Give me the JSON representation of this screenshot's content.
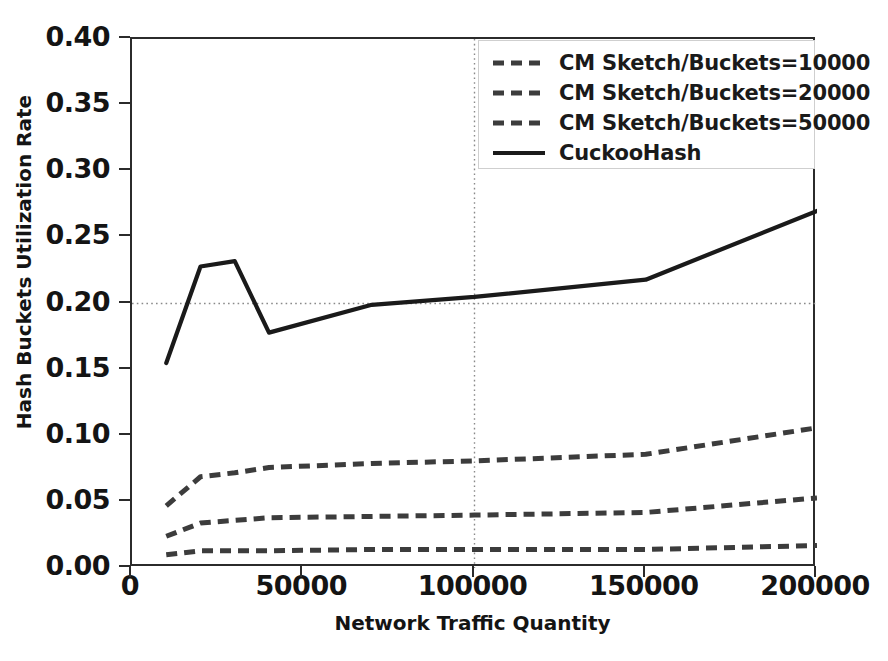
{
  "chart_data": {
    "type": "line",
    "title": "",
    "xlabel": "Network Traffic Quantity",
    "ylabel": "Hash Buckets Utilization Rate",
    "xlim": [
      0,
      200000
    ],
    "ylim": [
      0.0,
      0.4
    ],
    "xticks": [
      0,
      50000,
      100000,
      150000,
      200000
    ],
    "xtick_labels": [
      "0",
      "50000",
      "100000",
      "150000",
      "200000"
    ],
    "yticks": [
      0.0,
      0.05,
      0.1,
      0.15,
      0.2,
      0.25,
      0.3,
      0.35,
      0.4
    ],
    "ytick_labels": [
      "0.00",
      "0.05",
      "0.10",
      "0.15",
      "0.20",
      "0.25",
      "0.30",
      "0.35",
      "0.40"
    ],
    "grid": "dotted-crosshair",
    "gridlines": {
      "vertical_x": 100000,
      "horizontal_y": 0.2
    },
    "legend_position": "upper right",
    "x": [
      10000,
      20000,
      30000,
      40000,
      70000,
      100000,
      150000,
      200000
    ],
    "series": [
      {
        "name": "CM Sketch/Buckets=10000",
        "style": "dashed",
        "color": "#3c3c3c",
        "values": [
          0.047,
          0.069,
          0.072,
          0.076,
          0.079,
          0.081,
          0.086,
          0.106
        ]
      },
      {
        "name": "CM Sketch/Buckets=20000",
        "style": "dashed",
        "color": "#3c3c3c",
        "values": [
          0.024,
          0.034,
          0.036,
          0.038,
          0.039,
          0.04,
          0.042,
          0.053
        ]
      },
      {
        "name": "CM Sketch/Buckets=50000",
        "style": "dashed",
        "color": "#3c3c3c",
        "values": [
          0.01,
          0.013,
          0.013,
          0.013,
          0.014,
          0.014,
          0.014,
          0.017
        ]
      },
      {
        "name": "CuckooHash",
        "style": "solid",
        "color": "#1a1a1a",
        "values": [
          0.155,
          0.228,
          0.232,
          0.178,
          0.199,
          0.205,
          0.218,
          0.27
        ]
      }
    ]
  },
  "legend": {
    "entries": [
      {
        "label": "CM Sketch/Buckets=10000"
      },
      {
        "label": "CM Sketch/Buckets=20000"
      },
      {
        "label": "CM Sketch/Buckets=50000"
      },
      {
        "label": "CuckooHash"
      }
    ]
  }
}
